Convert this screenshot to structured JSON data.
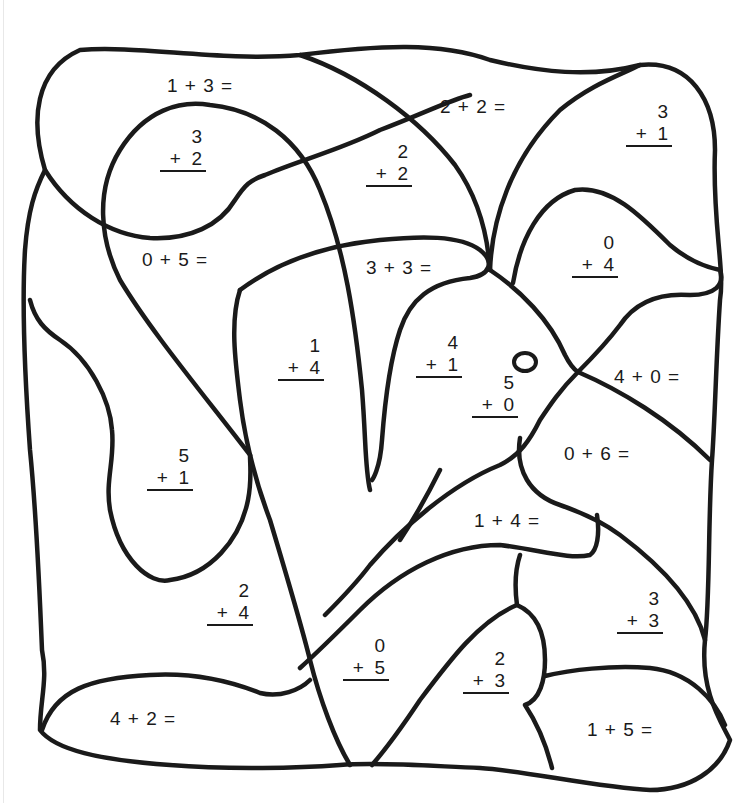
{
  "worksheet": {
    "type": "color-by-number addition coloring page",
    "problems": [
      {
        "id": "p1",
        "format": "horizontal",
        "text": "1 + 3 =",
        "a": 1,
        "b": 3
      },
      {
        "id": "p2",
        "format": "vertical",
        "top": "3",
        "bottom": "+  2",
        "a": 3,
        "b": 2
      },
      {
        "id": "p3",
        "format": "horizontal",
        "text": "2 + 2 =",
        "a": 2,
        "b": 2
      },
      {
        "id": "p4",
        "format": "vertical",
        "top": "2",
        "bottom": "+  2",
        "a": 2,
        "b": 2
      },
      {
        "id": "p5",
        "format": "vertical",
        "top": "3",
        "bottom": "+  1",
        "a": 3,
        "b": 1
      },
      {
        "id": "p6",
        "format": "horizontal",
        "text": "0 + 5 =",
        "a": 0,
        "b": 5
      },
      {
        "id": "p7",
        "format": "horizontal",
        "text": "3 + 3 =",
        "a": 3,
        "b": 3
      },
      {
        "id": "p8",
        "format": "vertical",
        "top": "0",
        "bottom": "+  4",
        "a": 0,
        "b": 4
      },
      {
        "id": "p9",
        "format": "vertical",
        "top": "1",
        "bottom": "+  4",
        "a": 1,
        "b": 4
      },
      {
        "id": "p10",
        "format": "vertical",
        "top": "4",
        "bottom": "+  1",
        "a": 4,
        "b": 1
      },
      {
        "id": "p11",
        "format": "vertical",
        "top": "5",
        "bottom": "+  0",
        "a": 5,
        "b": 0
      },
      {
        "id": "p12",
        "format": "horizontal",
        "text": "4 + 0 =",
        "a": 4,
        "b": 0
      },
      {
        "id": "p13",
        "format": "vertical",
        "top": "5",
        "bottom": "+  1",
        "a": 5,
        "b": 1
      },
      {
        "id": "p14",
        "format": "horizontal",
        "text": "0 + 6 =",
        "a": 0,
        "b": 6
      },
      {
        "id": "p15",
        "format": "horizontal",
        "text": "1 + 4 =",
        "a": 1,
        "b": 4
      },
      {
        "id": "p16",
        "format": "vertical",
        "top": "2",
        "bottom": "+  4",
        "a": 2,
        "b": 4
      },
      {
        "id": "p17",
        "format": "vertical",
        "top": "3",
        "bottom": "+  3",
        "a": 3,
        "b": 3
      },
      {
        "id": "p18",
        "format": "vertical",
        "top": "0",
        "bottom": "+  5",
        "a": 0,
        "b": 5
      },
      {
        "id": "p19",
        "format": "vertical",
        "top": "2",
        "bottom": "+  3",
        "a": 2,
        "b": 3
      },
      {
        "id": "p20",
        "format": "horizontal",
        "text": "4 + 2 =",
        "a": 4,
        "b": 2
      },
      {
        "id": "p21",
        "format": "horizontal",
        "text": "1 + 5 =",
        "a": 1,
        "b": 5
      }
    ],
    "colors": {
      "ink": "#1a1a1a",
      "paper": "#ffffff"
    },
    "decorations": {
      "eye": "small ring near the 5 + 0 region"
    }
  }
}
